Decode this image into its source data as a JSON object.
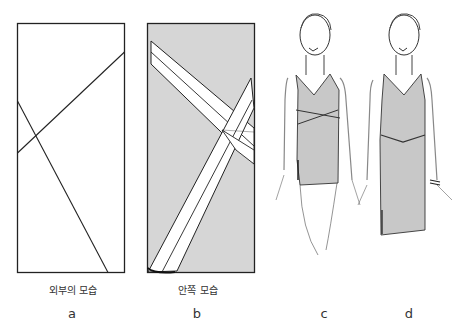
{
  "panels": [
    {
      "id": "a",
      "caption": "외부의 모습",
      "letter": "a"
    },
    {
      "id": "b",
      "caption": "안쪽 모습",
      "letter": "b"
    },
    {
      "id": "c",
      "caption": "",
      "letter": "c"
    },
    {
      "id": "d",
      "caption": "",
      "letter": "d"
    }
  ],
  "colors": {
    "outline": "#222222",
    "panel_b_fill": "#d6d6d6",
    "garment_fill": "#c8c8c8",
    "skin_fill": "#e6e6e6"
  }
}
